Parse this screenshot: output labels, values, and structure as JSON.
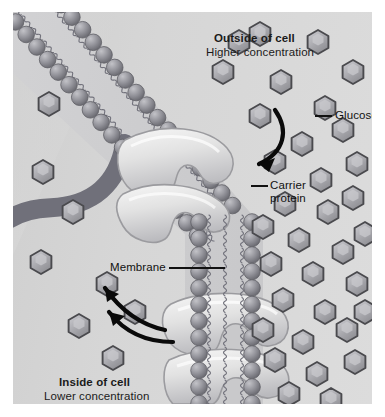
{
  "diagram": {
    "type": "biology-cell-membrane-transport",
    "labels": {
      "outside_title": "Outside of cell",
      "outside_subtitle": "Higher concentration",
      "inside_title": "Inside of cell",
      "inside_subtitle": "Lower concentration",
      "glucose": "Glucose",
      "carrier_line1": "Carrier",
      "carrier_line2": "protein",
      "membrane": "Membrane"
    },
    "colors": {
      "background": "#ffffff",
      "panel_outside": "#d8d8d8",
      "panel_inside": "#d5d5d5",
      "lipid_head": "#8f8f93",
      "lipid_tail": "#6f6f74",
      "glucose_fill": "#a9a9ad",
      "glucose_edge": "#4a4a4e",
      "protein_fill": "#e6e6e6",
      "protein_edge": "#9a9a9e",
      "arrow": "#0a0a0a",
      "text": "#1b1b1b"
    },
    "elements": {
      "lipid_bilayer": "phospholipid bilayer with spherical head groups and wavy fatty-acid tails",
      "carrier_proteins": 2,
      "arrows": 3,
      "glucose_outside_count": 34,
      "glucose_inside_count": 8
    }
  }
}
